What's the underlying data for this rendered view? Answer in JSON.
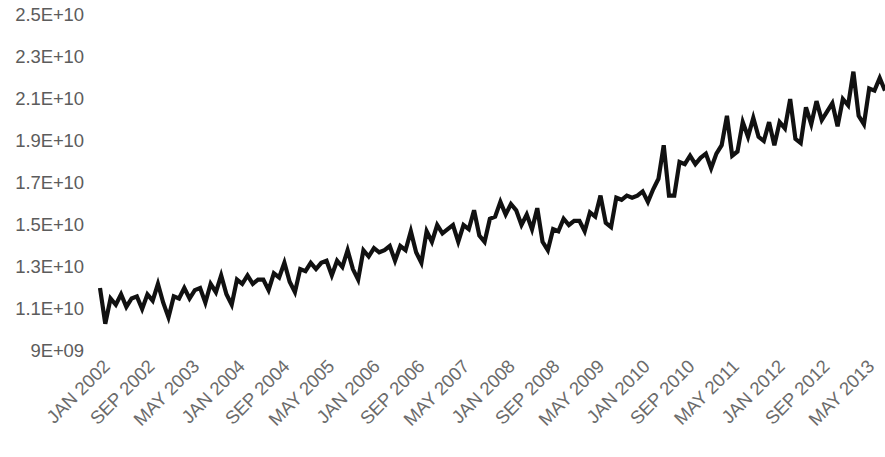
{
  "chart_data": {
    "type": "line",
    "title": "",
    "subtitle": "",
    "xlabel": "",
    "ylabel": "",
    "grid": false,
    "legend": false,
    "legend_position": "none",
    "line_color": "#111111",
    "text_color": "#5c5c5c",
    "background": "#ffffff",
    "ylim": [
      9000000000,
      25000000000
    ],
    "y_tick_labels": [
      "2.5E+10",
      "2.3E+10",
      "2.1E+10",
      "1.9E+10",
      "1.7E+10",
      "1.5E+10",
      "1.3E+10",
      "1.1E+10",
      "9E+09"
    ],
    "y_tick_values": [
      25000000000,
      23000000000,
      21000000000,
      19000000000,
      17000000000,
      15000000000,
      13000000000,
      11000000000,
      9000000000
    ],
    "x_tick_labels": [
      "JAN 2002",
      "SEP 2002",
      "MAY 2003",
      "JAN 2004",
      "SEP 2004",
      "MAY 2005",
      "JAN 2006",
      "SEP 2006",
      "MAY 2007",
      "JAN 2008",
      "SEP 2008",
      "MAY 2009",
      "JAN 2010",
      "SEP 2010",
      "MAY 2011",
      "JAN 2012",
      "SEP 2012",
      "MAY 2013"
    ],
    "x_tick_interval_months": 8,
    "x_start": "JAN 2002",
    "x_end": "JUN 2014",
    "x": [
      "JAN 2002",
      "FEB 2002",
      "MAR 2002",
      "APR 2002",
      "MAY 2002",
      "JUN 2002",
      "JUL 2002",
      "AUG 2002",
      "SEP 2002",
      "OCT 2002",
      "NOV 2002",
      "DEC 2002",
      "JAN 2003",
      "FEB 2003",
      "MAR 2003",
      "APR 2003",
      "MAY 2003",
      "JUN 2003",
      "JUL 2003",
      "AUG 2003",
      "SEP 2003",
      "OCT 2003",
      "NOV 2003",
      "DEC 2003",
      "JAN 2004",
      "FEB 2004",
      "MAR 2004",
      "APR 2004",
      "MAY 2004",
      "JUN 2004",
      "JUL 2004",
      "AUG 2004",
      "SEP 2004",
      "OCT 2004",
      "NOV 2004",
      "DEC 2004",
      "JAN 2005",
      "FEB 2005",
      "MAR 2005",
      "APR 2005",
      "MAY 2005",
      "JUN 2005",
      "JUL 2005",
      "AUG 2005",
      "SEP 2005",
      "OCT 2005",
      "NOV 2005",
      "DEC 2005",
      "JAN 2006",
      "FEB 2006",
      "MAR 2006",
      "APR 2006",
      "MAY 2006",
      "JUN 2006",
      "JUL 2006",
      "AUG 2006",
      "SEP 2006",
      "OCT 2006",
      "NOV 2006",
      "DEC 2006",
      "JAN 2007",
      "FEB 2007",
      "MAR 2007",
      "APR 2007",
      "MAY 2007",
      "JUN 2007",
      "JUL 2007",
      "AUG 2007",
      "SEP 2007",
      "OCT 2007",
      "NOV 2007",
      "DEC 2007",
      "JAN 2008",
      "FEB 2008",
      "MAR 2008",
      "APR 2008",
      "MAY 2008",
      "JUN 2008",
      "JUL 2008",
      "AUG 2008",
      "SEP 2008",
      "OCT 2008",
      "NOV 2008",
      "DEC 2008",
      "JAN 2009",
      "FEB 2009",
      "MAR 2009",
      "APR 2009",
      "MAY 2009",
      "JUN 2009",
      "JUL 2009",
      "AUG 2009",
      "SEP 2009",
      "OCT 2009",
      "NOV 2009",
      "DEC 2009",
      "JAN 2010",
      "FEB 2010",
      "MAR 2010",
      "APR 2010",
      "MAY 2010",
      "JUN 2010",
      "JUL 2010",
      "AUG 2010",
      "SEP 2010",
      "OCT 2010",
      "NOV 2010",
      "DEC 2010",
      "JAN 2011",
      "FEB 2011",
      "MAR 2011",
      "APR 2011",
      "MAY 2011",
      "JUN 2011",
      "JUL 2011",
      "AUG 2011",
      "SEP 2011",
      "OCT 2011",
      "NOV 2011",
      "DEC 2011",
      "JAN 2012",
      "FEB 2012",
      "MAR 2012",
      "APR 2012",
      "MAY 2012",
      "JUN 2012",
      "JUL 2012",
      "AUG 2012",
      "SEP 2012",
      "OCT 2012",
      "NOV 2012",
      "DEC 2012",
      "JAN 2013",
      "FEB 2013",
      "MAR 2013",
      "APR 2013",
      "MAY 2013",
      "JUN 2013",
      "JUL 2013",
      "AUG 2013",
      "SEP 2013",
      "OCT 2013",
      "NOV 2013",
      "DEC 2013",
      "JAN 2014",
      "FEB 2014",
      "MAR 2014",
      "APR 2014",
      "MAY 2014",
      "JUN 2014"
    ],
    "values": [
      12000000000,
      10300000000,
      11500000000,
      11200000000,
      11700000000,
      11100000000,
      11500000000,
      11600000000,
      11000000000,
      11700000000,
      11400000000,
      12200000000,
      11300000000,
      10600000000,
      11600000000,
      11500000000,
      12000000000,
      11500000000,
      11900000000,
      12000000000,
      11300000000,
      12200000000,
      11800000000,
      12600000000,
      11700000000,
      11200000000,
      12400000000,
      12200000000,
      12600000000,
      12200000000,
      12400000000,
      12400000000,
      11900000000,
      12700000000,
      12500000000,
      13200000000,
      12300000000,
      11800000000,
      12900000000,
      12800000000,
      13200000000,
      12900000000,
      13200000000,
      13300000000,
      12600000000,
      13300000000,
      13000000000,
      13800000000,
      12900000000,
      12400000000,
      13800000000,
      13500000000,
      13900000000,
      13700000000,
      13800000000,
      14000000000,
      13300000000,
      14000000000,
      13800000000,
      14700000000,
      13700000000,
      13200000000,
      14700000000,
      14200000000,
      15000000000,
      14600000000,
      14800000000,
      15000000000,
      14200000000,
      15000000000,
      14800000000,
      15700000000,
      14500000000,
      14200000000,
      15300000000,
      15400000000,
      16100000000,
      15500000000,
      16000000000,
      15700000000,
      15000000000,
      15500000000,
      14800000000,
      15800000000,
      14200000000,
      13800000000,
      14800000000,
      14700000000,
      15300000000,
      15000000000,
      15200000000,
      15200000000,
      14700000000,
      15600000000,
      15400000000,
      16400000000,
      15100000000,
      14900000000,
      16300000000,
      16200000000,
      16400000000,
      16300000000,
      16400000000,
      16600000000,
      16100000000,
      16700000000,
      17200000000,
      18800000000,
      16400000000,
      16400000000,
      18000000000,
      17900000000,
      18300000000,
      17900000000,
      18200000000,
      18400000000,
      17700000000,
      18400000000,
      18800000000,
      20200000000,
      18300000000,
      18500000000,
      19900000000,
      19200000000,
      20100000000,
      19200000000,
      19000000000,
      19900000000,
      18800000000,
      19900000000,
      19600000000,
      21000000000,
      19100000000,
      18900000000,
      20600000000,
      19800000000,
      20900000000,
      20000000000,
      20400000000,
      20800000000,
      19700000000,
      21000000000,
      20700000000,
      22300000000,
      20200000000,
      19800000000,
      21500000000,
      21400000000,
      22000000000,
      21400000000
    ]
  }
}
